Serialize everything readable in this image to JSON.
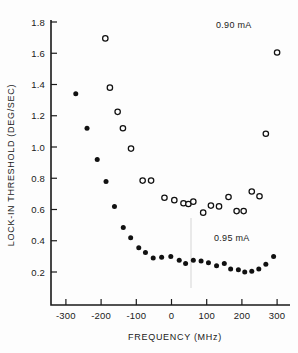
{
  "figure": {
    "background_color": "#fdfdfd",
    "ink_color": "#111111"
  },
  "axes": {
    "x_label": "FREQUENCY (MHz)",
    "y_label": "LOCK-IN THRESHOLD (DEG/SEC)",
    "x_ticks": [
      "-300",
      "-200",
      "-100",
      "0",
      "100",
      "200",
      "300"
    ],
    "y_ticks": [
      "1.8",
      "1.6",
      "1.4",
      "1.2",
      "1.0",
      "0.8",
      "0.6",
      "0.4",
      "0.2"
    ]
  },
  "annotations": {
    "upper_right": "0.90 mA",
    "lower_right": "0.95 mA"
  },
  "chart_data": {
    "type": "scatter",
    "title": "",
    "xlabel": "FREQUENCY (MHz)",
    "ylabel": "LOCK-IN THRESHOLD (DEG/SEC)",
    "xlim": [
      -330,
      330
    ],
    "ylim": [
      0.1,
      1.85
    ],
    "xticks": [
      -300,
      -200,
      -100,
      0,
      100,
      200,
      300
    ],
    "yticks": [
      0.2,
      0.4,
      0.6,
      0.8,
      1.0,
      1.2,
      1.4,
      1.6,
      1.8
    ],
    "grid": false,
    "legend": "inline-annotations",
    "series": [
      {
        "name": "0.95 mA",
        "marker": "filled-circle",
        "color": "#111111",
        "label_position": {
          "x": 240,
          "y": 0.4
        },
        "points": [
          {
            "x": -272,
            "y": 1.34
          },
          {
            "x": -240,
            "y": 1.12
          },
          {
            "x": -211,
            "y": 0.92
          },
          {
            "x": -186,
            "y": 0.78
          },
          {
            "x": -162,
            "y": 0.62
          },
          {
            "x": -137,
            "y": 0.485
          },
          {
            "x": -116,
            "y": 0.42
          },
          {
            "x": -93,
            "y": 0.355
          },
          {
            "x": -74,
            "y": 0.325
          },
          {
            "x": -52,
            "y": 0.29
          },
          {
            "x": -28,
            "y": 0.295
          },
          {
            "x": -2,
            "y": 0.3
          },
          {
            "x": 22,
            "y": 0.275
          },
          {
            "x": 40,
            "y": 0.255
          },
          {
            "x": 62,
            "y": 0.275
          },
          {
            "x": 84,
            "y": 0.27
          },
          {
            "x": 105,
            "y": 0.26
          },
          {
            "x": 128,
            "y": 0.24
          },
          {
            "x": 150,
            "y": 0.255
          },
          {
            "x": 168,
            "y": 0.22
          },
          {
            "x": 190,
            "y": 0.215
          },
          {
            "x": 208,
            "y": 0.2
          },
          {
            "x": 228,
            "y": 0.205
          },
          {
            "x": 248,
            "y": 0.22
          },
          {
            "x": 268,
            "y": 0.25
          },
          {
            "x": 290,
            "y": 0.3
          }
        ]
      },
      {
        "name": "0.90 mA",
        "marker": "open-circle",
        "color": "#111111",
        "label_position": {
          "x": 250,
          "y": 1.78
        },
        "points": [
          {
            "x": -188,
            "y": 1.695
          },
          {
            "x": -175,
            "y": 1.38
          },
          {
            "x": -153,
            "y": 1.225
          },
          {
            "x": -138,
            "y": 1.12
          },
          {
            "x": -115,
            "y": 0.99
          },
          {
            "x": -82,
            "y": 0.785
          },
          {
            "x": -58,
            "y": 0.785
          },
          {
            "x": -20,
            "y": 0.675
          },
          {
            "x": 8,
            "y": 0.66
          },
          {
            "x": 34,
            "y": 0.64
          },
          {
            "x": 48,
            "y": 0.635
          },
          {
            "x": 62,
            "y": 0.65
          },
          {
            "x": 90,
            "y": 0.58
          },
          {
            "x": 112,
            "y": 0.625
          },
          {
            "x": 135,
            "y": 0.62
          },
          {
            "x": 162,
            "y": 0.68
          },
          {
            "x": 185,
            "y": 0.59
          },
          {
            "x": 205,
            "y": 0.59
          },
          {
            "x": 228,
            "y": 0.715
          },
          {
            "x": 250,
            "y": 0.685
          },
          {
            "x": 268,
            "y": 1.085
          },
          {
            "x": 300,
            "y": 1.605
          }
        ]
      }
    ]
  }
}
